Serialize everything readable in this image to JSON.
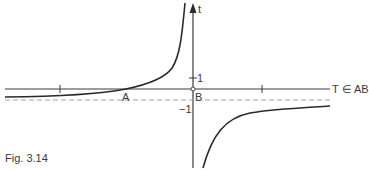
{
  "figure": {
    "caption": "Fig. 3.14",
    "x_axis_label": "T ∈ AB",
    "y_axis_label": "t",
    "point_a_label": "A",
    "point_b_label": "B",
    "tick_y_pos_label": "1",
    "tick_y_neg_label": "−1"
  },
  "colors": {
    "curve": "#2a2a2a",
    "axis": "#3a3a3a",
    "asymptote": "#9a9a9a"
  }
}
